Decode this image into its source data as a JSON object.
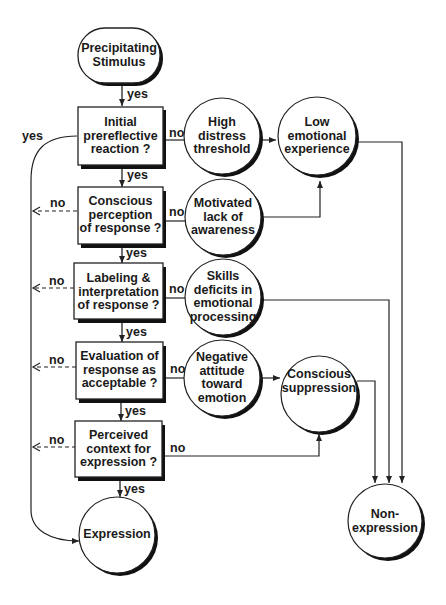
{
  "diagram": {
    "type": "flowchart",
    "colors": {
      "stroke": "#222222",
      "shadow": "#111111",
      "fill": "#ffffff"
    },
    "nodes": {
      "start": {
        "shape": "terminal",
        "lines": [
          "Precipitating",
          "Stimulus"
        ]
      },
      "q1": {
        "shape": "decision-box",
        "lines": [
          "Initial",
          "prereflective",
          "reaction ?"
        ]
      },
      "q2": {
        "shape": "decision-box",
        "lines": [
          "Conscious",
          "perception",
          "of response ?"
        ]
      },
      "q3": {
        "shape": "decision-box",
        "lines": [
          "Labeling &",
          "interpretation",
          "of response ?"
        ]
      },
      "q4": {
        "shape": "decision-box",
        "lines": [
          "Evaluation of",
          "response as",
          "acceptable ?"
        ]
      },
      "q5": {
        "shape": "decision-box",
        "lines": [
          "Perceived",
          "context for",
          "expression ?"
        ]
      },
      "expression": {
        "shape": "circle",
        "lines": [
          "Expression"
        ]
      },
      "high_distress": {
        "shape": "circle",
        "lines": [
          "High",
          "distress",
          "threshold"
        ]
      },
      "motivated": {
        "shape": "circle",
        "lines": [
          "Motivated",
          "lack of",
          "awareness"
        ]
      },
      "skills": {
        "shape": "circle",
        "lines": [
          "Skills",
          "deficits in",
          "emotional",
          "processing"
        ]
      },
      "negative": {
        "shape": "circle",
        "lines": [
          "Negative",
          "attitude",
          "toward",
          "emotion"
        ]
      },
      "low_emotional": {
        "shape": "circle",
        "lines": [
          "Low",
          "emotional",
          "experience"
        ]
      },
      "suppression": {
        "shape": "circle",
        "lines": [
          "Conscious",
          "suppression"
        ]
      },
      "nonexpression": {
        "shape": "circle",
        "lines": [
          "Non-",
          "expression"
        ]
      }
    },
    "edge_labels": {
      "yes": "yes",
      "no": "no"
    },
    "edges": [
      {
        "from": "start",
        "to": "q1",
        "label": "yes"
      },
      {
        "from": "q1",
        "to": "q2",
        "label": "yes"
      },
      {
        "from": "q2",
        "to": "q3",
        "label": "yes"
      },
      {
        "from": "q3",
        "to": "q4",
        "label": "yes"
      },
      {
        "from": "q4",
        "to": "q5",
        "label": "yes"
      },
      {
        "from": "q5",
        "to": "expression",
        "label": "yes"
      },
      {
        "from": "q1",
        "to": "expression",
        "label": "yes",
        "style": "curved-left"
      },
      {
        "from": "q1",
        "to": "high_distress",
        "label": "no"
      },
      {
        "from": "q2",
        "to": "motivated",
        "label": "no"
      },
      {
        "from": "q3",
        "to": "skills",
        "label": "no"
      },
      {
        "from": "q4",
        "to": "negative",
        "label": "no"
      },
      {
        "from": "q5",
        "to": "suppression",
        "label": "no"
      },
      {
        "from": "q2",
        "to": "left",
        "label": "no",
        "style": "dashed"
      },
      {
        "from": "q3",
        "to": "left",
        "label": "no",
        "style": "dashed"
      },
      {
        "from": "q4",
        "to": "left",
        "label": "no",
        "style": "dashed"
      },
      {
        "from": "q5",
        "to": "left",
        "label": "no",
        "style": "dashed"
      },
      {
        "from": "high_distress",
        "to": "low_emotional"
      },
      {
        "from": "motivated",
        "to": "low_emotional"
      },
      {
        "from": "negative",
        "to": "suppression"
      },
      {
        "from": "low_emotional",
        "to": "nonexpression"
      },
      {
        "from": "skills",
        "to": "nonexpression"
      },
      {
        "from": "suppression",
        "to": "nonexpression"
      }
    ]
  }
}
